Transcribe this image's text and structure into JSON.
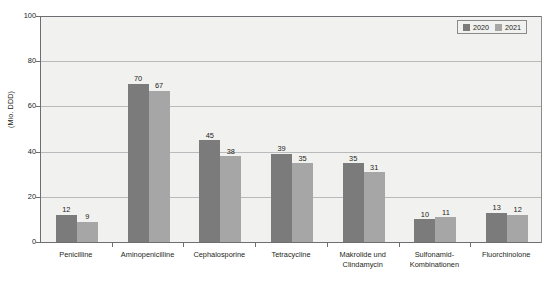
{
  "chart_data": {
    "type": "bar",
    "title": "",
    "subtitle": "",
    "xlabel": "",
    "ylabel": "(Mio. DDD)",
    "ylim": [
      0,
      100
    ],
    "yticks": [
      0,
      20,
      40,
      60,
      80,
      100
    ],
    "grid": "horizontal",
    "legend_position": "top-right",
    "categories": [
      "Penicilline",
      "Aminopenicilline",
      "Cephalosporine",
      "Tetracycline",
      "Makrolide und Clindamycin",
      "Sulfonamid- Kombinationen",
      "Fluorchinolone"
    ],
    "category_lines": [
      [
        "Penicilline"
      ],
      [
        "Aminopenicilline"
      ],
      [
        "Cephalosporine"
      ],
      [
        "Tetracycline"
      ],
      [
        "Makrolide und",
        "Clindamycin"
      ],
      [
        "Sulfonamid-",
        "Kombinationen"
      ],
      [
        "Fluorchinolone"
      ]
    ],
    "series": [
      {
        "name": "2020",
        "color": "#7b7b7b",
        "values": [
          12,
          70,
          45,
          39,
          35,
          10,
          13
        ]
      },
      {
        "name": "2021",
        "color": "#a6a6a6",
        "values": [
          9,
          67,
          38,
          35,
          31,
          11,
          12
        ]
      }
    ]
  },
  "legend": {
    "items": [
      {
        "label": "2020",
        "color": "#7b7b7b"
      },
      {
        "label": "2021",
        "color": "#a6a6a6"
      }
    ]
  },
  "axes": {
    "y_title": "(Mio. DDD)",
    "y_tick_labels": [
      "100",
      "80",
      "60",
      "40",
      "20",
      "0"
    ]
  },
  "colors": {
    "plot_background": "#f1f1ef",
    "page_background": "#ffffff",
    "gridline": "#b9babc",
    "axis": "#6d6e71",
    "text": "#231f20",
    "series_2020": "#7b7b7b",
    "series_2021": "#a6a6a6"
  }
}
